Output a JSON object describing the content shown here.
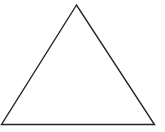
{
  "diagram": {
    "shape": "triangle",
    "vertices": [
      [
        76.5,
        5
      ],
      [
        1.5,
        124.5
      ],
      [
        154.5,
        124.5
      ]
    ],
    "stroke": "#222222",
    "fill": "#ffffff",
    "stroke_width": 1.4,
    "labels": []
  }
}
